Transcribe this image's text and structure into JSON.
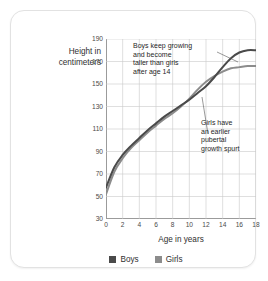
{
  "chart_data": {
    "type": "line",
    "title": "",
    "xlabel": "Age in years",
    "ylabel": "Height in centimeters",
    "xlim": [
      0,
      18
    ],
    "ylim": [
      30,
      190
    ],
    "xticks": [
      0,
      2,
      4,
      6,
      8,
      10,
      12,
      14,
      16,
      18
    ],
    "yticks": [
      30,
      50,
      70,
      90,
      110,
      130,
      150,
      170,
      190
    ],
    "grid": true,
    "legend_position": "bottom",
    "x": [
      0,
      1,
      2,
      3,
      4,
      5,
      6,
      7,
      8,
      9,
      10,
      11,
      12,
      13,
      14,
      15,
      16,
      17,
      18
    ],
    "series": [
      {
        "name": "Boys",
        "color": "#4a4a4a",
        "values": [
          58,
          76,
          87,
          95,
          102,
          109,
          115,
          121,
          126,
          131,
          136,
          142,
          148,
          156,
          165,
          173,
          178,
          180,
          180
        ]
      },
      {
        "name": "Girls",
        "color": "#8c8c8c",
        "values": [
          52,
          72,
          84,
          93,
          100,
          107,
          113,
          119,
          124,
          130,
          137,
          145,
          152,
          157,
          161,
          164,
          165,
          166,
          166
        ]
      }
    ],
    "annotations": [
      {
        "id": "boys-note",
        "text": "Boys keep growing\nand become\ntaller than girls\nafter age 14",
        "points_to": {
          "x": 16,
          "y": 178
        }
      },
      {
        "id": "girls-note",
        "text": "Girls have\nan earlier\npubertal\ngrowth spurt",
        "points_to": {
          "x": 12,
          "y": 152
        }
      }
    ]
  },
  "axis": {
    "y_title_line1": "Height in",
    "y_title_line2": "centimeters",
    "x_title": "Age in years"
  },
  "legend": {
    "boys_label": "Boys",
    "girls_label": "Girls",
    "boys_color": "#4a4a4a",
    "girls_color": "#8c8c8c"
  },
  "annotations": {
    "boys_note": "Boys keep growing\nand become\ntaller than girls\nafter age 14",
    "girls_note": "Girls have\nan earlier\npubertal\ngrowth spurt"
  }
}
